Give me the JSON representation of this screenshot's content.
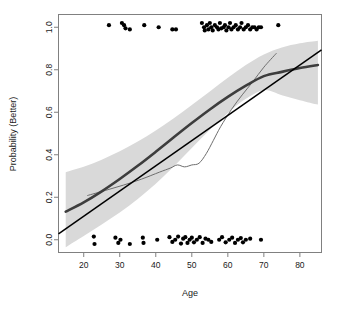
{
  "figure": {
    "background_color": "#ffffff",
    "frame_color": "#808080",
    "point_color": "#000000",
    "band_color": "#d9d9d9",
    "linear_line_color": "#000000",
    "logistic_line_color": "#3d3d3d",
    "spline_line_color": "#6e6e6e"
  },
  "chart_data": {
    "type": "scatter",
    "title": "",
    "subtitle": "",
    "xlabel": "Age",
    "ylabel": "Probability (Better)",
    "xlim": [
      13,
      86
    ],
    "ylim": [
      -0.06,
      1.06
    ],
    "xticks": [
      20,
      30,
      40,
      50,
      60,
      70,
      80
    ],
    "xtick_labels": [
      "20",
      "30",
      "40",
      "50",
      "60",
      "70",
      "80"
    ],
    "yticks": [
      0.0,
      0.2,
      0.4,
      0.6,
      0.8,
      1.0
    ],
    "ytick_labels": [
      "0.0",
      "0.2",
      "0.4",
      "0.6",
      "0.8",
      "1.0"
    ],
    "grid": false,
    "legend": null,
    "annotations": [],
    "series": [
      {
        "name": "Observations (Better = 1)",
        "type": "scatter",
        "marker": "filled-circle",
        "x": [
          27.0,
          30.6,
          31.2,
          31.6,
          32.8,
          36.8,
          40.8,
          44.6,
          45.6,
          52.8,
          53.4,
          53.6,
          54.2,
          54.6,
          55.0,
          55.4,
          55.8,
          56.4,
          57.0,
          57.4,
          57.8,
          58.2,
          58.8,
          59.2,
          59.6,
          60.2,
          60.6,
          61.0,
          61.6,
          62.2,
          62.8,
          63.4,
          63.8,
          64.4,
          65.0,
          65.6,
          66.2,
          66.8,
          67.4,
          68.0,
          68.6,
          69.2,
          74.0
        ],
        "y": [
          1.01,
          1.02,
          1.01,
          0.995,
          0.99,
          1.01,
          1.0,
          0.99,
          0.99,
          1.02,
          1.0,
          0.985,
          1.01,
          0.99,
          1.02,
          1.0,
          0.985,
          1.01,
          1.0,
          0.99,
          1.02,
          0.995,
          1.0,
          1.01,
          0.985,
          1.0,
          1.02,
          0.99,
          1.0,
          1.01,
          0.99,
          1.0,
          1.02,
          0.99,
          1.0,
          1.01,
          0.99,
          1.0,
          1.0,
          0.99,
          1.0,
          1.0,
          1.01
        ]
      },
      {
        "name": "Observations (Better = 0)",
        "type": "scatter",
        "marker": "filled-circle",
        "x": [
          22.8,
          23.0,
          28.8,
          29.6,
          30.2,
          32.8,
          36.4,
          36.6,
          40.4,
          43.8,
          44.6,
          45.4,
          46.2,
          47.0,
          47.6,
          48.2,
          48.8,
          49.4,
          50.0,
          50.6,
          51.4,
          52.2,
          53.0,
          53.8,
          54.6,
          55.4,
          57.6,
          58.4,
          59.4,
          60.4,
          61.2,
          62.0,
          62.8,
          63.6,
          64.2,
          65.0,
          66.2,
          69.2
        ],
        "y": [
          0.015,
          -0.02,
          0.01,
          -0.015,
          0.0,
          -0.02,
          0.01,
          -0.015,
          0.0,
          0.012,
          -0.01,
          0.0,
          0.015,
          -0.018,
          0.005,
          0.012,
          -0.015,
          0.0,
          0.01,
          -0.012,
          0.0,
          0.012,
          -0.015,
          0.005,
          0.0,
          -0.01,
          0.0,
          0.012,
          -0.012,
          0.0,
          0.01,
          -0.015,
          0.0,
          0.008,
          -0.012,
          0.0,
          0.005,
          0.0
        ]
      },
      {
        "name": "Linear fit",
        "type": "line",
        "x": [
          13.0,
          86.0
        ],
        "y": [
          0.028,
          0.893
        ]
      },
      {
        "name": "Logistic fit",
        "type": "line",
        "x": [
          15.0,
          20.0,
          25.0,
          30.0,
          35.0,
          40.0,
          45.0,
          50.0,
          55.0,
          60.0,
          65.0,
          70.0,
          75.0,
          80.0,
          85.0
        ],
        "y": [
          0.132,
          0.176,
          0.228,
          0.286,
          0.348,
          0.414,
          0.482,
          0.549,
          0.613,
          0.672,
          0.725,
          0.77,
          0.79,
          0.808,
          0.822
        ]
      },
      {
        "name": "Smoothing spline",
        "type": "line",
        "x": [
          21.0,
          26.0,
          31.0,
          36.0,
          41.0,
          44.0,
          46.0,
          48.0,
          50.0,
          52.0,
          54.0,
          56.0,
          58.0,
          61.0,
          64.0,
          67.0,
          70.0,
          73.5
        ],
        "y": [
          0.208,
          0.232,
          0.257,
          0.285,
          0.318,
          0.337,
          0.352,
          0.343,
          0.352,
          0.36,
          0.405,
          0.468,
          0.532,
          0.613,
          0.682,
          0.745,
          0.812,
          0.878
        ]
      },
      {
        "name": "Confidence band upper",
        "type": "band-edge",
        "x": [
          15.0,
          20.0,
          25.0,
          30.0,
          35.0,
          40.0,
          45.0,
          50.0,
          55.0,
          60.0,
          65.0,
          70.0,
          75.0,
          80.0,
          85.0
        ],
        "y": [
          0.318,
          0.343,
          0.377,
          0.416,
          0.462,
          0.514,
          0.572,
          0.634,
          0.698,
          0.762,
          0.822,
          0.872,
          0.905,
          0.925,
          0.937
        ]
      },
      {
        "name": "Confidence band lower",
        "type": "band-edge",
        "x": [
          15.0,
          20.0,
          25.0,
          30.0,
          35.0,
          40.0,
          45.0,
          50.0,
          55.0,
          60.0,
          65.0,
          70.0,
          75.0,
          80.0,
          85.0
        ],
        "y": [
          -0.035,
          0.018,
          0.072,
          0.128,
          0.192,
          0.264,
          0.345,
          0.432,
          0.518,
          0.597,
          0.663,
          0.704,
          0.68,
          0.657,
          0.636
        ]
      }
    ]
  }
}
